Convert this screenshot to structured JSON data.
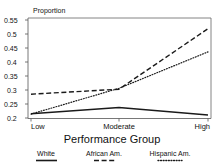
{
  "chart_data": {
    "type": "line",
    "title": "",
    "ylabel": "Proportion",
    "xlabel": "Performance Group",
    "categories": [
      "Low",
      "Moderate",
      "High"
    ],
    "ylim": [
      0.2,
      0.55
    ],
    "yticks": [
      "0.2",
      "0.25",
      "0.3",
      "0.35",
      "0.4",
      "0.45",
      "0.5",
      "0.55"
    ],
    "ytick_values": [
      0.2,
      0.25,
      0.3,
      0.35,
      0.4,
      0.45,
      0.5,
      0.55
    ],
    "grid": false,
    "legend_position": "below",
    "series": [
      {
        "name": "White",
        "style": "solid",
        "values": [
          0.215,
          0.237,
          0.211
        ]
      },
      {
        "name": "African Am.",
        "style": "dashed",
        "values": [
          0.285,
          0.303,
          0.519
        ]
      },
      {
        "name": "Hispanic Am.",
        "style": "dotted",
        "values": [
          0.214,
          0.306,
          0.436
        ]
      }
    ]
  },
  "axis": {
    "y_title": "Proportion",
    "x_title": "Performance Group",
    "y_ticks": [
      "0.55",
      "0.5",
      "0.45",
      "0.4",
      "0.35",
      "0.3",
      "0.25",
      "0.2"
    ],
    "x_ticks": [
      "Low",
      "Moderate",
      "High"
    ]
  },
  "legend": {
    "items": [
      {
        "label": "White",
        "style": "solid"
      },
      {
        "label": "African Am.",
        "style": "dashed"
      },
      {
        "label": "Hispanic Am.",
        "style": "dotted"
      }
    ]
  },
  "colors": {
    "line": "#1a1a1a",
    "axis": "#555555",
    "background": "#ffffff",
    "text": "#111111"
  }
}
